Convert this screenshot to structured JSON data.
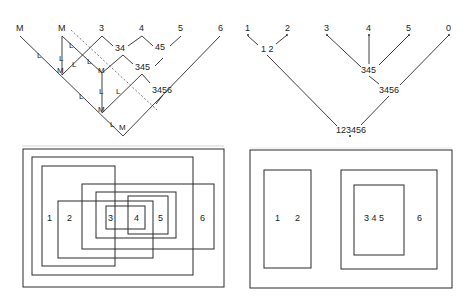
{
  "left_tree": {
    "leaves": [
      "M",
      "M",
      "3",
      "4",
      "5",
      "6"
    ],
    "merges": [
      "34",
      "45",
      "345",
      "3456"
    ],
    "edge_labels": [
      "L",
      "L",
      "L",
      "L",
      "L",
      "L",
      "L",
      "L",
      "L",
      "L",
      "L"
    ],
    "node_labels": [
      "M",
      "M",
      "M",
      "M"
    ]
  },
  "right_tree": {
    "leaves": [
      "1",
      "2",
      "3",
      "4",
      "5",
      "0"
    ],
    "merges": [
      "1 2",
      "345",
      "3456",
      "123456"
    ]
  },
  "left_venn": {
    "labels": [
      "1",
      "2",
      "3",
      "4",
      "5",
      "6"
    ]
  },
  "right_venn": {
    "labels": [
      "1",
      "2",
      "3 4 5",
      "6"
    ]
  },
  "colors": {
    "line": "#2a2a2a",
    "background": "#ffffff"
  }
}
